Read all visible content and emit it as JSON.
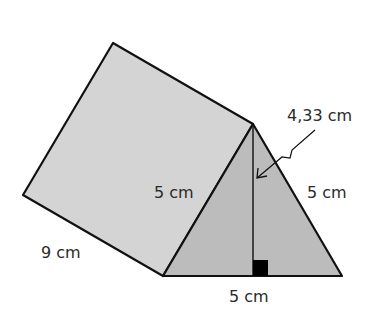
{
  "diagram": {
    "type": "triangular-prism",
    "colors": {
      "background": "#ffffff",
      "rectangular_face": "#d4d4d4",
      "triangular_face": "#bcbcbc",
      "stroke": "#111111",
      "right_angle_marker": "#000000",
      "text": "#2a2a2a"
    },
    "labels": {
      "height": "4,33 cm",
      "triangle_left_side": "5 cm",
      "triangle_right_side": "5 cm",
      "triangle_base": "5 cm",
      "prism_length": "9 cm"
    }
  }
}
